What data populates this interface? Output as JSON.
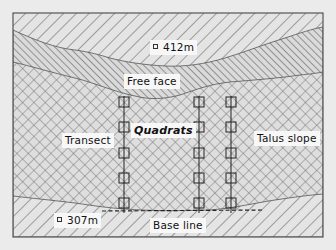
{
  "diagram": {
    "background_color": "#ebebeb",
    "frame_color": "#555555",
    "line_color": "#333333",
    "labels": {
      "elevation_top": "412m",
      "free_face": "Free face",
      "quadrats": "Quadrats",
      "transect": "Transect",
      "talus_slope": "Talus slope",
      "elevation_bottom": "307m",
      "base_line": "Base line"
    },
    "zones": [
      {
        "name": "Cliff top",
        "pattern": "wide diagonal hatch"
      },
      {
        "name": "Free face",
        "pattern": "dense diagonal hatch"
      },
      {
        "name": "Talus slope",
        "pattern": "cross hatch"
      },
      {
        "name": "Valley floor",
        "pattern": "wide diagonal hatch"
      }
    ],
    "transects": [
      {
        "id": "transect-1",
        "x": 124,
        "quadrat_count": 5
      },
      {
        "id": "transect-2",
        "x": 199,
        "quadrat_count": 5
      },
      {
        "id": "transect-3",
        "x": 231,
        "quadrat_count": 5
      }
    ],
    "quadrat_rows_y": [
      102,
      127,
      153,
      178,
      203
    ]
  }
}
